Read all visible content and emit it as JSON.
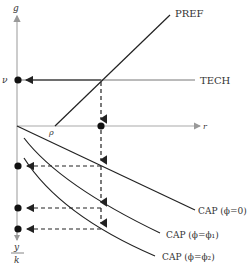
{
  "diagram": {
    "axes": {
      "y_label": "g",
      "x_label": "r",
      "y_bottom_label_num": "y",
      "y_bottom_label_den": "k"
    },
    "markers": {
      "nu": "ν",
      "rho": "ρ"
    },
    "curves": {
      "pref": "PREF",
      "tech": "TECH",
      "cap0": "CAP (ϕ=0)",
      "cap1": "CAP (ϕ=ϕ₁)",
      "cap2": "CAP (ϕ=ϕ₂)"
    },
    "colors": {
      "line": "#333333",
      "axis": "#aaaaaa",
      "background": "#ffffff"
    }
  }
}
